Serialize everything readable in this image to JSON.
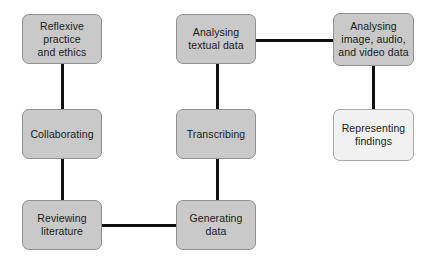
{
  "diagram": {
    "canvas": {
      "width": 442,
      "height": 266,
      "background": "#ffffff"
    },
    "style": {
      "node_fill": "#c9c9c9",
      "node_fill_light": "#f1f1f1",
      "node_border": "#8f8f8f",
      "edge_color": "#101010",
      "text_color": "#1a1a1a"
    },
    "nodes": [
      {
        "id": "reflexive-practice-and-ethics",
        "label": "Reflexive\npractice\nand ethics",
        "column": "left",
        "row": "top",
        "fill": "gray"
      },
      {
        "id": "collaborating",
        "label": "Collaborating",
        "column": "left",
        "row": "middle",
        "fill": "gray"
      },
      {
        "id": "reviewing-literature",
        "label": "Reviewing\nliterature",
        "column": "left",
        "row": "bottom",
        "fill": "gray"
      },
      {
        "id": "analysing-textual-data",
        "label": "Analysing\ntextual data",
        "column": "center",
        "row": "top",
        "fill": "gray"
      },
      {
        "id": "transcribing",
        "label": "Transcribing",
        "column": "center",
        "row": "middle",
        "fill": "gray"
      },
      {
        "id": "generating-data",
        "label": "Generating\ndata",
        "column": "center",
        "row": "bottom",
        "fill": "gray"
      },
      {
        "id": "analysing-image-audio-and-video-data",
        "label": "Analysing\nimage, audio,\nand video data",
        "column": "right",
        "row": "top",
        "fill": "gray"
      },
      {
        "id": "representing-findings",
        "label": "Representing\nfindings",
        "column": "right",
        "row": "middle",
        "fill": "light"
      }
    ],
    "edges": [
      {
        "id": "reflexive-to-collaborating",
        "from": "reflexive-practice-and-ethics",
        "to": "collaborating",
        "orientation": "vertical"
      },
      {
        "id": "collaborating-to-reviewing-literature",
        "from": "collaborating",
        "to": "reviewing-literature",
        "orientation": "vertical"
      },
      {
        "id": "reviewing-literature-to-generating-data",
        "from": "reviewing-literature",
        "to": "generating-data",
        "orientation": "horizontal"
      },
      {
        "id": "generating-data-to-transcribing",
        "from": "generating-data",
        "to": "transcribing",
        "orientation": "vertical"
      },
      {
        "id": "transcribing-to-analysing-textual-data",
        "from": "transcribing",
        "to": "analysing-textual-data",
        "orientation": "vertical"
      },
      {
        "id": "analysing-textual-data-to-analysing-image-audio-and-video-data",
        "from": "analysing-textual-data",
        "to": "analysing-image-audio-and-video-data",
        "orientation": "horizontal"
      },
      {
        "id": "analysing-image-audio-and-video-data-to-representing-findings",
        "from": "analysing-image-audio-and-video-data",
        "to": "representing-findings",
        "orientation": "vertical"
      }
    ]
  }
}
